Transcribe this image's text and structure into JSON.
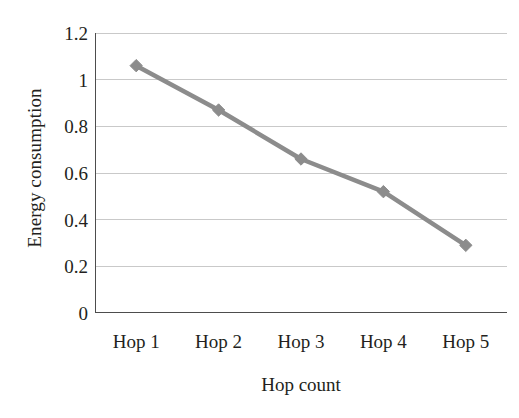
{
  "chart_data": {
    "type": "line",
    "title": "",
    "xlabel": "Hop count",
    "ylabel": "Energy consumption",
    "categories": [
      "Hop 1",
      "Hop 2",
      "Hop 3",
      "Hop 4",
      "Hop 5"
    ],
    "series": [
      {
        "name": "Energy consumption",
        "values": [
          1.06,
          0.87,
          0.66,
          0.52,
          0.29
        ],
        "color": "#8c8c8c",
        "marker": "diamond"
      }
    ],
    "ylim": [
      0,
      1.2
    ],
    "y_ticks": [
      0,
      0.2,
      0.4,
      0.6,
      0.8,
      1,
      1.2
    ],
    "y_tick_labels": [
      "0",
      "0.2",
      "0.4",
      "0.6",
      "0.8",
      "1",
      "1.2"
    ],
    "grid": true,
    "gridline_color": "#c9c9c9",
    "axis_color": "#4d4d4d",
    "legend": "none",
    "legend_position": "none",
    "background": "#ffffff"
  }
}
